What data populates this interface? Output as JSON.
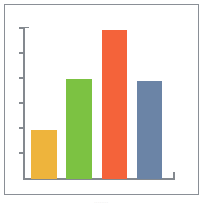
{
  "figure": {
    "background_color": "#ffffff",
    "frame_color": "#8a8f96",
    "axis_color": "#84898f",
    "caption_text": "........"
  },
  "chart_data": {
    "type": "bar",
    "title": "",
    "subtitle": "",
    "xlabel": "",
    "ylabel": "",
    "categories": [
      "1",
      "2",
      "3",
      "4"
    ],
    "values": [
      33,
      67,
      100,
      66
    ],
    "ylim": [
      0,
      100
    ],
    "xlim": [
      0,
      4
    ],
    "y_tick_values": [
      0,
      17,
      33,
      50,
      67,
      83,
      100
    ],
    "y_tick_labels": [
      "",
      "",
      "",
      "",
      "",
      "",
      ""
    ],
    "x_tick_labels": [
      "",
      "",
      "",
      ""
    ],
    "grid": false,
    "legend": false,
    "legend_position": "none",
    "annotations": [],
    "bar_colors": [
      "#eeb43c",
      "#7cc242",
      "#f4633a",
      "#6b84a6"
    ],
    "bars": [
      {
        "name": "bar-1",
        "category": "1",
        "value": 33,
        "color": "#eeb43c",
        "height_pct": 32.5,
        "left_pct": 4,
        "width_pct": 17
      },
      {
        "name": "bar-2",
        "category": "2",
        "value": 67,
        "color": "#7cc242",
        "height_pct": 65.5,
        "left_pct": 27.5,
        "width_pct": 17
      },
      {
        "name": "bar-3",
        "category": "3",
        "value": 100,
        "color": "#f4633a",
        "height_pct": 98,
        "left_pct": 51,
        "width_pct": 17
      },
      {
        "name": "bar-4",
        "category": "4",
        "value": 66,
        "color": "#6b84a6",
        "height_pct": 64.5,
        "left_pct": 74.5,
        "width_pct": 17
      }
    ]
  }
}
